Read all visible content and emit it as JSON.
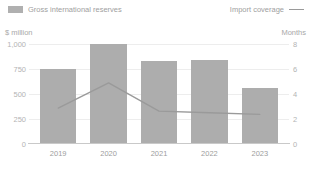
{
  "legend": {
    "bar_series_label": "Gross international reserves",
    "line_series_label": "Import coverage",
    "bar_swatch_icon": "bar-swatch-icon",
    "line_swatch_icon": "line-swatch-icon",
    "bar_color": "#adadad",
    "line_color": "#9a9a9a"
  },
  "axes": {
    "left_unit": "$ million",
    "right_unit": "Months",
    "left_ticks": [
      "0",
      "250",
      "500",
      "750",
      "1,000"
    ],
    "right_ticks": [
      "0",
      "2",
      "4",
      "6",
      "8"
    ]
  },
  "chart_data": {
    "type": "bar",
    "title": "",
    "xlabel": "",
    "ylabel": "$ million",
    "y2label": "Months",
    "categories": [
      "2019",
      "2020",
      "2021",
      "2022",
      "2023"
    ],
    "ylim": [
      0,
      1000
    ],
    "y2lim": [
      0,
      8
    ],
    "yticks": [
      0,
      250,
      500,
      750,
      1000
    ],
    "y2ticks": [
      0,
      2,
      4,
      6,
      8
    ],
    "grid": true,
    "legend_position": "top",
    "series": [
      {
        "name": "Gross international reserves",
        "type": "bar",
        "axis": "left",
        "values": [
          750,
          1000,
          830,
          840,
          557
        ]
      },
      {
        "name": "Import coverage",
        "type": "line",
        "axis": "right",
        "values": [
          1.9,
          4.3,
          1.6,
          1.45,
          1.3
        ]
      }
    ]
  }
}
